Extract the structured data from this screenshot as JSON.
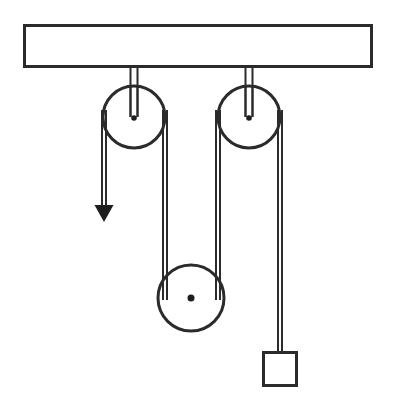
{
  "figure": {
    "title": "Pulley system diagram",
    "background_color": "#ffffff",
    "line_color": "#2b2b2b",
    "accent_color": "#1d1d1d"
  },
  "support": {
    "name": "ceiling-beam",
    "label": "",
    "x": 23,
    "y": 24,
    "width": 350,
    "height": 44
  },
  "pulleys": [
    {
      "id": "fixed-pulley-left",
      "label": "",
      "type": "fixed",
      "cx": 134,
      "cy": 117,
      "r": 31,
      "hanger_top_y": 24,
      "hanger_width": 8
    },
    {
      "id": "fixed-pulley-right",
      "label": "",
      "type": "fixed",
      "cx": 249,
      "cy": 117,
      "r": 31,
      "hanger_top_y": 24,
      "hanger_width": 8
    },
    {
      "id": "movable-pulley-bottom",
      "label": "",
      "type": "movable",
      "cx": 191,
      "cy": 298,
      "r": 33,
      "axle_r": 3.5
    }
  ],
  "ropes": [
    {
      "id": "rope-free-end",
      "label": "",
      "from": "fixed-pulley-left",
      "x": 104,
      "y_top": 117,
      "y_bottom": 207,
      "has_arrow": true,
      "arrow_direction": "down",
      "arrow_tip_y": 222
    },
    {
      "id": "rope-left-to-movable",
      "label": "",
      "from": "fixed-pulley-left",
      "to": "movable-pulley-bottom",
      "x": 165,
      "y_top": 117,
      "y_bottom": 298
    },
    {
      "id": "rope-movable-to-right",
      "label": "",
      "from": "movable-pulley-bottom",
      "to": "fixed-pulley-right",
      "x": 218,
      "y_top": 298,
      "y_bottom": 117
    },
    {
      "id": "rope-right-to-weight",
      "label": "",
      "from": "fixed-pulley-right",
      "to": "weight-block",
      "x": 280,
      "y_top": 117,
      "y_bottom": 352
    }
  ],
  "weight": {
    "id": "weight-block",
    "label": "",
    "x": 262,
    "y": 351,
    "width": 35,
    "height": 35
  },
  "annotations": {
    "force_arrow_label": "",
    "weight_label": ""
  }
}
